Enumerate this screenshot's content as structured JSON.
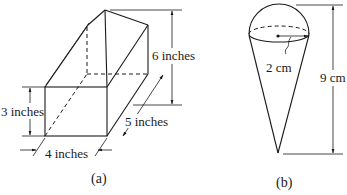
{
  "figure_a": {
    "caption": "(a)",
    "shape": "rectangular box with triangular prism top",
    "labels": {
      "front_height": "3 inches",
      "total_height": "6 inches",
      "depth": "5 inches",
      "width": "4 inches"
    }
  },
  "figure_b": {
    "caption": "(b)",
    "shape": "cone topped with hemisphere",
    "labels": {
      "radius": "2 cm",
      "total_height": "9 cm"
    }
  }
}
